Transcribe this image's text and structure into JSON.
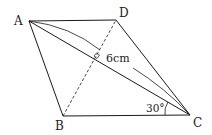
{
  "diagram": {
    "type": "geometry",
    "shape": "parallelogram",
    "colors": {
      "stroke": "#1a1a1a",
      "background": "#ffffff"
    },
    "vertices": {
      "A": {
        "label": "A",
        "x": 29,
        "y": 21
      },
      "B": {
        "label": "B",
        "x": 63,
        "y": 116
      },
      "C": {
        "label": "C",
        "x": 190,
        "y": 115
      },
      "D": {
        "label": "D",
        "x": 116,
        "y": 20
      }
    },
    "segments": [
      {
        "from": "A",
        "to": "D",
        "style": "solid"
      },
      {
        "from": "D",
        "to": "C",
        "style": "solid"
      },
      {
        "from": "C",
        "to": "B",
        "style": "solid"
      },
      {
        "from": "B",
        "to": "A",
        "style": "solid"
      },
      {
        "from": "A",
        "to": "C",
        "style": "solid",
        "role": "diagonal"
      },
      {
        "from": "B",
        "to": "D",
        "style": "dashed",
        "role": "diagonal"
      }
    ],
    "annotations": {
      "length_label": "6cm",
      "angle_label": "30°",
      "right_angle_marker": true
    }
  }
}
